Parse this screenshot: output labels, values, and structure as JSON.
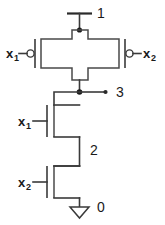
{
  "diagram": {
    "type": "circuit-schematic",
    "background_color": "#ffffff",
    "line_color": "#3a3a3a"
  },
  "nodes": {
    "supply": {
      "label": "1",
      "name": "vdd-node"
    },
    "output": {
      "label": "3",
      "name": "output-node"
    },
    "intermediate": {
      "label": "2",
      "name": "intermediate-node"
    },
    "ground": {
      "label": "0",
      "name": "ground-node"
    }
  },
  "inputs": {
    "pmos_left": {
      "base": "x",
      "sub": "1"
    },
    "pmos_right": {
      "base": "x",
      "sub": "2"
    },
    "nmos_top": {
      "base": "x",
      "sub": "1"
    },
    "nmos_bottom": {
      "base": "x",
      "sub": "2"
    }
  },
  "devices": [
    {
      "name": "pmos-pair",
      "kind": "pmos",
      "inverted_gate": true,
      "count": 2
    },
    {
      "name": "nmos-top",
      "kind": "nmos",
      "inverted_gate": false
    },
    {
      "name": "nmos-bottom",
      "kind": "nmos",
      "inverted_gate": false
    }
  ],
  "symbols": {
    "ground": "gnd-triangle",
    "supply_rail": "vdd-bar",
    "gate_bubble": "inversion-bubble",
    "junction": "connection-dot"
  }
}
